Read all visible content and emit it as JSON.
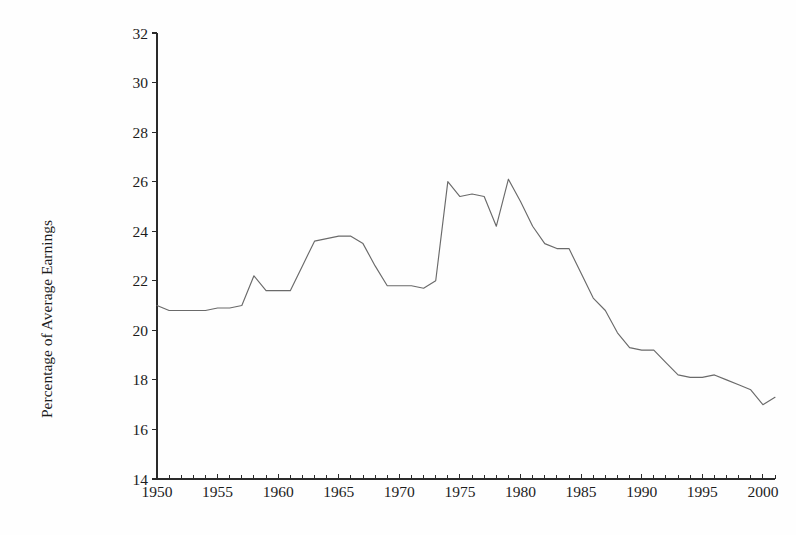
{
  "chart_data": {
    "type": "line",
    "title": "",
    "subtitle": "",
    "xlabel": "",
    "ylabel": "Percentage of Average Earnings",
    "xlim": [
      1950,
      2001
    ],
    "ylim": [
      14,
      32
    ],
    "grid": false,
    "legend": "none",
    "y_ticks": [
      14,
      16,
      18,
      20,
      22,
      24,
      26,
      28,
      30,
      32
    ],
    "y_tick_labels": [
      "14",
      "16",
      "18",
      "20",
      "22",
      "24",
      "26",
      "28",
      "30",
      "32"
    ],
    "x_ticks": [
      1950,
      1955,
      1960,
      1965,
      1970,
      1975,
      1980,
      1985,
      1990,
      1995,
      2000
    ],
    "x_tick_labels": [
      "1950",
      "1955",
      "1960",
      "1965",
      "1970",
      "1975",
      "1980",
      "1985",
      "1990",
      "1995",
      "2000"
    ],
    "x_minor_tick_step": 1,
    "line_color": "#6a6a6a",
    "axis_color": "#2a2a2a",
    "background_color": "#ffffff",
    "series": [
      {
        "name": "Percentage of Average Earnings",
        "x": [
          1950,
          1951,
          1952,
          1953,
          1954,
          1955,
          1956,
          1957,
          1958,
          1959,
          1960,
          1961,
          1962,
          1963,
          1964,
          1965,
          1966,
          1967,
          1968,
          1969,
          1970,
          1971,
          1972,
          1973,
          1974,
          1975,
          1976,
          1977,
          1978,
          1979,
          1980,
          1981,
          1982,
          1983,
          1984,
          1985,
          1986,
          1987,
          1988,
          1989,
          1990,
          1991,
          1992,
          1993,
          1994,
          1995,
          1996,
          1997,
          1998,
          1999,
          2000,
          2001
        ],
        "values": [
          21.0,
          20.8,
          20.8,
          20.8,
          20.8,
          20.9,
          20.9,
          21.0,
          22.2,
          21.6,
          21.6,
          21.6,
          22.6,
          23.6,
          23.7,
          23.8,
          23.8,
          23.5,
          22.6,
          21.8,
          21.8,
          21.8,
          21.7,
          22.0,
          26.0,
          25.4,
          25.5,
          25.4,
          24.2,
          26.1,
          25.2,
          24.2,
          23.5,
          23.3,
          23.3,
          22.3,
          21.3,
          20.8,
          19.9,
          19.3,
          19.2,
          19.2,
          18.7,
          18.2,
          18.1,
          18.1,
          18.2,
          18.0,
          17.8,
          17.6,
          17.0,
          17.3
        ]
      }
    ]
  },
  "axis": {
    "y_label": "Percentage of Average Earnings"
  }
}
